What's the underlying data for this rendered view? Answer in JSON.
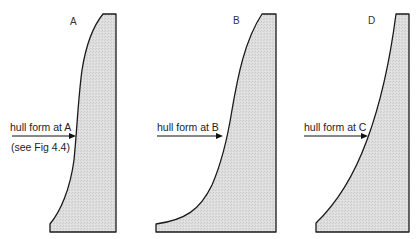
{
  "figure": {
    "panels": [
      {
        "id": "A",
        "letter": "A",
        "annotation": "hull form at A",
        "sub_annotation": "(see Fig 4.4)"
      },
      {
        "id": "B",
        "letter": "B",
        "annotation": "hull form at B"
      },
      {
        "id": "D",
        "letter": "D",
        "annotation": "hull form at C"
      }
    ],
    "colors": {
      "fill": "#dcdcdc",
      "stroke": "#1a1a1a",
      "background": "#ffffff"
    }
  }
}
